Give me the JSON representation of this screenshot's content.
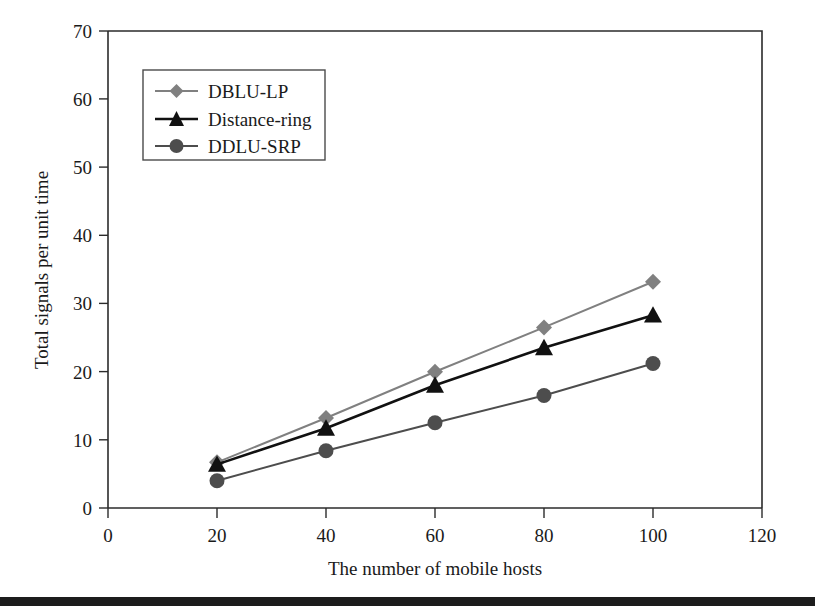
{
  "chart_data": {
    "type": "line",
    "title": "",
    "xlabel": "The number of mobile hosts",
    "ylabel": "Total signals per unit time",
    "x": [
      20,
      40,
      60,
      80,
      100
    ],
    "xlim": [
      0,
      120
    ],
    "ylim": [
      0,
      70
    ],
    "x_ticks": [
      0,
      20,
      40,
      60,
      80,
      100,
      120
    ],
    "y_ticks": [
      0,
      10,
      20,
      30,
      40,
      50,
      60,
      70
    ],
    "x_tick_labels": [
      "0",
      "20",
      "40",
      "60",
      "80",
      "100",
      "120"
    ],
    "y_tick_labels": [
      "0",
      "10",
      "20",
      "30",
      "40",
      "50",
      "60",
      "70"
    ],
    "grid": false,
    "legend_position": "upper-left",
    "series": [
      {
        "name": "DBLU-LP",
        "marker": "diamond",
        "color": "#808080",
        "values": [
          6.7,
          13.2,
          20.0,
          26.5,
          33.2
        ]
      },
      {
        "name": "Distance-ring",
        "marker": "triangle",
        "color": "#111111",
        "values": [
          6.4,
          11.7,
          18.0,
          23.5,
          28.3
        ]
      },
      {
        "name": "DDLU-SRP",
        "marker": "circle",
        "color": "#4d4d4d",
        "values": [
          4.0,
          8.4,
          12.5,
          16.5,
          21.2
        ]
      }
    ]
  },
  "axes": {
    "x_label": "The number of mobile hosts",
    "y_label": "Total signals per unit time",
    "x_ticks": [
      "0",
      "20",
      "40",
      "60",
      "80",
      "100",
      "120"
    ],
    "y_ticks": [
      "0",
      "10",
      "20",
      "30",
      "40",
      "50",
      "60",
      "70"
    ]
  },
  "legend": {
    "entries": [
      {
        "label": "DBLU-LP",
        "marker": "diamond-marker-icon",
        "color": "#808080"
      },
      {
        "label": "Distance-ring",
        "marker": "triangle-marker-icon",
        "color": "#111111"
      },
      {
        "label": "DDLU-SRP",
        "marker": "circle-marker-icon",
        "color": "#4d4d4d"
      }
    ]
  },
  "decor": {
    "bottom_bar_color": "#1c1c1c"
  }
}
